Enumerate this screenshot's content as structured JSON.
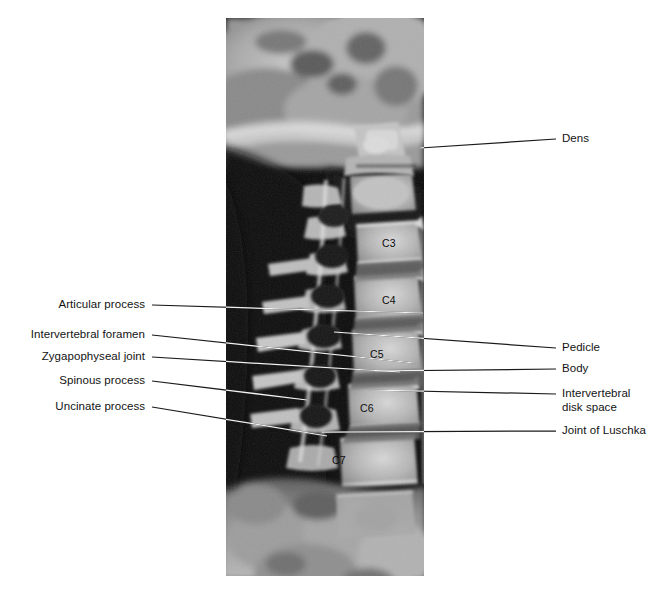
{
  "figure": {
    "background_color": "#ffffff",
    "label_color": "#131313",
    "leader_line_color_light_bg": "#1a1a1a",
    "leader_line_color_dark_bg": "#f2f2f2"
  },
  "xray": {
    "x": 226,
    "y": 18,
    "width": 198,
    "height": 558,
    "description": "Lateral radiograph of the cervical spine showing skull base, mandible and cervical vertebrae C3 through C7"
  },
  "labels_left": [
    {
      "id": "articular-process",
      "text": "Articular process",
      "text_right": 145,
      "text_baseline": 309,
      "line_start_x": 152,
      "line_start_y": 305,
      "line_end_x": 423,
      "line_end_y": 313
    },
    {
      "id": "intervertebral-foramen",
      "text": "Intervertebral foramen",
      "text_right": 145,
      "text_baseline": 339,
      "line_start_x": 152,
      "line_start_y": 335,
      "line_end_x": 414,
      "line_end_y": 363
    },
    {
      "id": "zygapophyseal-joint",
      "text": "Zygapophyseal joint",
      "text_right": 145,
      "text_baseline": 361,
      "line_start_x": 152,
      "line_start_y": 357,
      "line_end_x": 400,
      "line_end_y": 372
    },
    {
      "id": "spinous-process",
      "text": "Spinous process",
      "text_right": 145,
      "text_baseline": 385,
      "line_start_x": 152,
      "line_start_y": 381,
      "line_end_x": 307,
      "line_end_y": 400
    },
    {
      "id": "uncinate-process",
      "text": "Uncinate process",
      "text_right": 145,
      "text_baseline": 411,
      "line_start_x": 152,
      "line_start_y": 407,
      "line_end_x": 327,
      "line_end_y": 436
    }
  ],
  "labels_right": [
    {
      "id": "dens",
      "text": "Dens",
      "text_left": 562,
      "text_baseline": 143,
      "line_start_x": 556,
      "line_start_y": 139,
      "line_end_x": 420,
      "line_end_y": 148
    },
    {
      "id": "pedicle",
      "text": "Pedicle",
      "text_left": 562,
      "text_baseline": 352,
      "line_start_x": 556,
      "line_start_y": 348,
      "line_end_x": 334,
      "line_end_y": 332
    },
    {
      "id": "body",
      "text": "Body",
      "text_left": 562,
      "text_baseline": 373,
      "line_start_x": 556,
      "line_start_y": 369,
      "line_end_x": 375,
      "line_end_y": 371
    },
    {
      "id": "intervertebral-disk-space",
      "text": "Intervertebral\ndisk space",
      "text_left": 562,
      "text_baseline": 398,
      "line_start_x": 556,
      "line_start_y": 394,
      "line_end_x": 368,
      "line_end_y": 390
    },
    {
      "id": "joint-of-luschka",
      "text": "Joint of Luschka",
      "text_left": 562,
      "text_baseline": 435,
      "line_start_x": 556,
      "line_start_y": 431,
      "line_end_x": 322,
      "line_end_y": 432
    }
  ],
  "vertebra_labels": [
    {
      "id": "c3",
      "text": "C3",
      "x": 382,
      "y": 245
    },
    {
      "id": "c4",
      "text": "C4",
      "x": 382,
      "y": 302
    },
    {
      "id": "c5",
      "text": "C5",
      "x": 370,
      "y": 356
    },
    {
      "id": "c6",
      "text": "C6",
      "x": 360,
      "y": 410
    },
    {
      "id": "c7",
      "text": "C7",
      "x": 332,
      "y": 462
    }
  ]
}
